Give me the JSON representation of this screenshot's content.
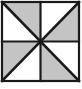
{
  "figure": {
    "name": "pinwheel-square",
    "canvas": {
      "width": 82,
      "height": 89
    },
    "square": {
      "left": 2,
      "top": 2,
      "right": 79,
      "bottom": 81,
      "width": 77,
      "height": 79
    },
    "center": {
      "x": 40.5,
      "y": 41.5
    },
    "colors": {
      "shaded_fill": "#c4c4c4",
      "unshaded_fill": "#ffffff",
      "line": "#1a1a1a",
      "background": "#ffffff"
    },
    "stroke": {
      "border_width": 2.2,
      "midline_width": 2.2,
      "diagonal_width": 2.6
    },
    "counts": {
      "total_triangles": 8,
      "shaded_triangles": 4,
      "unshaded_triangles": 4
    },
    "quadrants": [
      {
        "name": "top-left",
        "diagonal": "top-left-to-center",
        "shaded_triangle": "upper-right",
        "unshaded_triangle": "lower-left"
      },
      {
        "name": "top-right",
        "diagonal": "top-right-to-center",
        "shaded_triangle": "lower-right",
        "unshaded_triangle": "upper-left"
      },
      {
        "name": "bottom-right",
        "diagonal": "bottom-right-to-center",
        "shaded_triangle": "lower-left",
        "unshaded_triangle": "upper-right"
      },
      {
        "name": "bottom-left",
        "diagonal": "bottom-left-to-center",
        "shaded_triangle": "upper-left",
        "unshaded_triangle": "lower-right"
      }
    ],
    "shaded_polygons": [
      {
        "name": "triangle-tl-upper-right",
        "points": "2,2 40.5,2 40.5,41.5"
      },
      {
        "name": "triangle-tr-lower-right",
        "points": "79,2 79,41.5 40.5,41.5"
      },
      {
        "name": "triangle-br-lower-left",
        "points": "79,81 40.5,81 40.5,41.5"
      },
      {
        "name": "triangle-bl-upper-left",
        "points": "2,81 2,41.5 40.5,41.5"
      }
    ],
    "unshaded_polygons": [
      {
        "name": "triangle-tl-lower-left",
        "points": "2,2 40.5,41.5 2,41.5"
      },
      {
        "name": "triangle-tr-upper-left",
        "points": "40.5,2 79,2 40.5,41.5"
      },
      {
        "name": "triangle-br-upper-right",
        "points": "40.5,41.5 79,41.5 79,81"
      },
      {
        "name": "triangle-bl-lower-right",
        "points": "40.5,41.5 40.5,81 2,81"
      }
    ],
    "lines": [
      {
        "name": "border-top",
        "x1": 2,
        "y1": 2,
        "x2": 79,
        "y2": 2
      },
      {
        "name": "border-right",
        "x1": 79,
        "y1": 2,
        "x2": 79,
        "y2": 81
      },
      {
        "name": "border-bottom",
        "x1": 79,
        "y1": 81,
        "x2": 2,
        "y2": 81
      },
      {
        "name": "border-left",
        "x1": 2,
        "y1": 81,
        "x2": 2,
        "y2": 2
      },
      {
        "name": "midline-horizontal",
        "x1": 2,
        "y1": 41.5,
        "x2": 79,
        "y2": 41.5
      },
      {
        "name": "midline-vertical",
        "x1": 40.5,
        "y1": 2,
        "x2": 40.5,
        "y2": 81
      },
      {
        "name": "diagonal-main",
        "x1": 2,
        "y1": 2,
        "x2": 79,
        "y2": 81
      },
      {
        "name": "diagonal-anti",
        "x1": 79,
        "y1": 2,
        "x2": 2,
        "y2": 81
      }
    ]
  }
}
